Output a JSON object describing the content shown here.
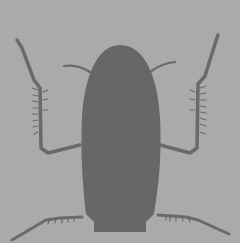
{
  "image": {
    "subject": "insect silhouette",
    "colors": {
      "background": "#a8a8a8",
      "silhouette": "#676767",
      "legs": "#6c6c6c"
    }
  }
}
